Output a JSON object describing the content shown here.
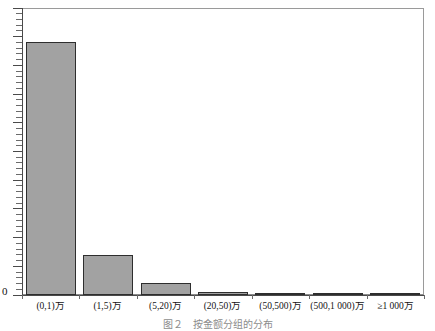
{
  "chart_data": {
    "type": "bar",
    "title": "",
    "subtitle": "",
    "xlabel": "",
    "ylabel": "",
    "grid": false,
    "legend": false,
    "categories": [
      "(0,1)万",
      "(1,5)万",
      "(5,20)万",
      "(20,50)万",
      "(50,500)万",
      "(500,1 000)万",
      "≥1 000万"
    ],
    "values": [
      88,
      14,
      4.2,
      0.9,
      0.6,
      0.5,
      0.4
    ],
    "ylim": [
      0,
      100
    ],
    "ytick_labels": [
      "0"
    ],
    "bar_color": "#a2a2a2",
    "bar_edge_color": "#2e2e2e",
    "axis_color": "#4a4a4a",
    "frame_color": "#8a8a8a"
  },
  "axes": {
    "y_zero_label": "0"
  },
  "caption": {
    "text": "图２　按金额分组的分布"
  }
}
